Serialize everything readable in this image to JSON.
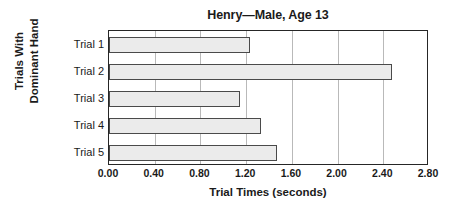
{
  "chart_data": {
    "type": "bar",
    "orientation": "horizontal",
    "title": "Henry—Male, Age 13",
    "xlabel": "Trial Times (seconds)",
    "ylabel_lines": [
      "Trials With",
      "Dominant Hand"
    ],
    "ylabel": "Trials With Dominant Hand",
    "categories": [
      "Trial 1",
      "Trial 2",
      "Trial 3",
      "Trial 4",
      "Trial 5"
    ],
    "values": [
      1.23,
      2.48,
      1.15,
      1.33,
      1.47
    ],
    "xlim": [
      0.0,
      2.8
    ],
    "xticks": [
      0.0,
      0.4,
      0.8,
      1.2,
      1.6,
      2.0,
      2.4,
      2.8
    ],
    "xtick_labels": [
      "0.00",
      "0.40",
      "0.80",
      "1.20",
      "1.60",
      "2.00",
      "2.40",
      "2.80"
    ],
    "grid": "vertical",
    "legend": null,
    "bar_fill_color": "#ebebeb",
    "bar_border_color": "#4a4a4a",
    "gridline_color": "#b9b9b9",
    "axis_color": "#262626"
  }
}
